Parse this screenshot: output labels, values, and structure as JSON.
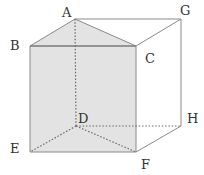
{
  "diagram": {
    "type": "triangular-prism-in-cube",
    "colors": {
      "shade": "#e3e3e3",
      "edge": "#8a8a8a",
      "hidden_edge": "#6a6a6a",
      "label": "#333333"
    },
    "vertices": {
      "A": {
        "x": 75,
        "y": 19
      },
      "G": {
        "x": 181,
        "y": 19
      },
      "B": {
        "x": 30,
        "y": 46
      },
      "C": {
        "x": 136,
        "y": 46
      },
      "D": {
        "x": 76,
        "y": 126
      },
      "H": {
        "x": 181,
        "y": 126
      },
      "E": {
        "x": 30,
        "y": 152
      },
      "F": {
        "x": 136,
        "y": 152
      }
    },
    "labels": [
      {
        "text": "A",
        "x": 62,
        "y": 17
      },
      {
        "text": "G",
        "x": 180,
        "y": 15
      },
      {
        "text": "B",
        "x": 10,
        "y": 50
      },
      {
        "text": "C",
        "x": 145,
        "y": 63
      },
      {
        "text": "D",
        "x": 78,
        "y": 123
      },
      {
        "text": "H",
        "x": 187,
        "y": 123
      },
      {
        "text": "E",
        "x": 10,
        "y": 153
      },
      {
        "text": "F",
        "x": 141,
        "y": 169
      }
    ]
  }
}
